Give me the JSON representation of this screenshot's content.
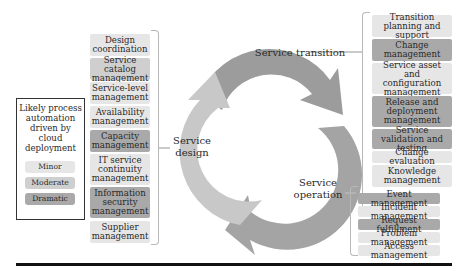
{
  "legend": {
    "title": "Likely process automation driven by cloud deployment",
    "levels": [
      {
        "label": "Minor",
        "color": "#e6e6e6"
      },
      {
        "label": "Moderate",
        "color": "#cfcfcf"
      },
      {
        "label": "Dramatic",
        "color": "#a9a9a9"
      }
    ]
  },
  "cycle": {
    "stages": [
      {
        "label": "Service transition"
      },
      {
        "label": "Service operation"
      },
      {
        "label": "Service design"
      }
    ]
  },
  "service_design": {
    "items": [
      {
        "label": "Design coordination",
        "level": "Minor"
      },
      {
        "label": "Service catalog management",
        "level": "Moderate"
      },
      {
        "label": "Service-level management",
        "level": "Minor"
      },
      {
        "label": "Availability management",
        "level": "Minor"
      },
      {
        "label": "Capacity management",
        "level": "Dramatic"
      },
      {
        "label": "IT service continuity management",
        "level": "Minor"
      },
      {
        "label": "Information security management",
        "level": "Dramatic"
      },
      {
        "label": "Supplier management",
        "level": "Minor"
      }
    ]
  },
  "service_transition": {
    "items": [
      {
        "label": "Transition planning and support",
        "level": "Minor"
      },
      {
        "label": "Change management",
        "level": "Dramatic"
      },
      {
        "label": "Service asset and configuration management",
        "level": "Minor"
      },
      {
        "label": "Release and deployment management",
        "level": "Dramatic"
      },
      {
        "label": "Service validation and testing",
        "level": "Dramatic"
      },
      {
        "label": "Change evaluation",
        "level": "Minor"
      },
      {
        "label": "Knowledge management",
        "level": "Minor"
      }
    ]
  },
  "service_operation": {
    "items": [
      {
        "label": "Event management",
        "level": "Dramatic"
      },
      {
        "label": "Incident management",
        "level": "Minor"
      },
      {
        "label": "Request fulfillment",
        "level": "Dramatic"
      },
      {
        "label": "Problem management",
        "level": "Minor"
      },
      {
        "label": "Access management",
        "level": "Minor"
      }
    ]
  }
}
